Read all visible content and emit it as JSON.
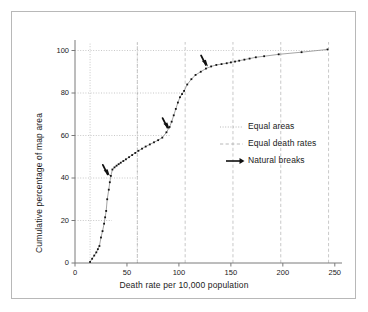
{
  "chart_data": {
    "type": "line",
    "title": "",
    "xlabel": "Death rate per 10,000 population",
    "ylabel": "Cumulative percentage of map area",
    "xlim": [
      0,
      255
    ],
    "ylim": [
      0,
      104
    ],
    "xticks": [
      0,
      50,
      100,
      150,
      200,
      250
    ],
    "yticks": [
      0,
      20,
      40,
      60,
      80,
      100
    ],
    "grid": "partial-dotted",
    "legend_position": "right-middle",
    "series": [
      {
        "name": "Cumulative percentage of map area",
        "x": [
          14.5,
          16.5,
          18.5,
          20.5,
          22.0,
          23.5,
          25.0,
          26.5,
          28.0,
          29.0,
          30.0,
          31.0,
          32.5,
          33.5,
          34.5,
          36.0,
          38.0,
          40.0,
          42.0,
          44.0,
          46.5,
          49.0,
          52.0,
          55.0,
          58.0,
          61.0,
          64.5,
          68.0,
          72.0,
          76.0,
          80.0,
          84.0,
          88.0,
          91.0,
          93.0,
          95.0,
          97.0,
          99.0,
          101.0,
          103.0,
          105.0,
          108.0,
          112.0,
          116.0,
          121.0,
          126.0,
          131.0,
          136.0,
          141.0,
          146.0,
          150.0,
          154.0,
          158.0,
          163.0,
          168.0,
          174.0,
          182.0,
          196.0,
          218.0,
          243.0
        ],
        "y": [
          0.5,
          2.0,
          3.5,
          5.0,
          6.5,
          8.0,
          12.0,
          15.0,
          18.5,
          21.5,
          24.5,
          30.0,
          34.5,
          38.0,
          41.0,
          44.0,
          45.0,
          45.8,
          46.5,
          47.2,
          48.0,
          48.8,
          49.8,
          50.8,
          51.8,
          52.8,
          53.8,
          54.8,
          55.8,
          56.8,
          57.8,
          59.0,
          61.5,
          64.0,
          66.5,
          69.5,
          72.5,
          75.5,
          78.0,
          79.5,
          81.0,
          84.0,
          86.5,
          88.5,
          90.0,
          91.5,
          92.5,
          93.2,
          93.6,
          94.0,
          94.4,
          94.8,
          95.2,
          95.7,
          96.2,
          96.8,
          97.3,
          98.2,
          99.2,
          100.5
        ]
      }
    ],
    "equal_areas_vlines": [
      14.5,
      60.0
    ],
    "equal_areas_hlines": [
      {
        "y": 20,
        "x_end": 35.5
      },
      {
        "y": 40,
        "x_end": 60.0
      },
      {
        "y": 60,
        "x_end": 91.5
      },
      {
        "y": 80,
        "x_end": 104.0
      },
      {
        "y": 100,
        "x_end": 243.0
      }
    ],
    "equal_death_rates_vlines": [
      60.0,
      106.0,
      152.0,
      198.0,
      244.0
    ],
    "natural_breaks_arrows": [
      {
        "x": 33.5,
        "y": 41.0
      },
      {
        "x": 91.0,
        "y": 63.0
      },
      {
        "x": 128.0,
        "y": 92.5
      }
    ]
  },
  "legend": {
    "items": [
      {
        "label": "Equal areas",
        "style": "dotted",
        "color": "#8a8a8a"
      },
      {
        "label": "Equal death rates",
        "style": "dashed",
        "color": "#8a8a8a"
      },
      {
        "label": "Natural breaks",
        "style": "arrow",
        "color": "#111111"
      }
    ]
  },
  "colors": {
    "frame": "#b8b8b8",
    "axis": "#7a7a7a",
    "curve": "#8d8d8d",
    "marker": "#111111",
    "gridline": "#b0b0b0",
    "text": "#1a1a1a"
  }
}
